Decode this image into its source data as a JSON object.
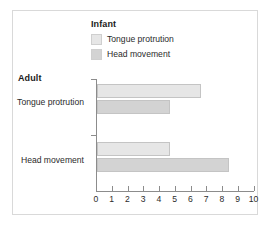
{
  "chart_data": {
    "type": "bar",
    "orientation": "horizontal",
    "title": "",
    "xlabel": "",
    "ylabel": "Adult",
    "legend_title": "Infant",
    "legend_position": "top",
    "grid": false,
    "xlim": [
      0,
      10
    ],
    "xticks": [
      "0",
      "1",
      "2",
      "3",
      "4",
      "5",
      "6",
      "7",
      "8",
      "9",
      "10"
    ],
    "categories": [
      "Tongue protrution",
      "Head movement"
    ],
    "series": [
      {
        "name": "Tongue protrution",
        "color": "#e6e6e6",
        "values": [
          6.6,
          4.65
        ]
      },
      {
        "name": "Head movement",
        "color": "#d3d3d3",
        "values": [
          4.65,
          8.35
        ]
      }
    ]
  },
  "axes": {
    "group_title": "Adult"
  },
  "colors": {
    "frame_border": "#d9d9d9",
    "axis": "#8c8c8c",
    "text": "#2b2b2b",
    "bar_edge": "#c4c4c4"
  }
}
